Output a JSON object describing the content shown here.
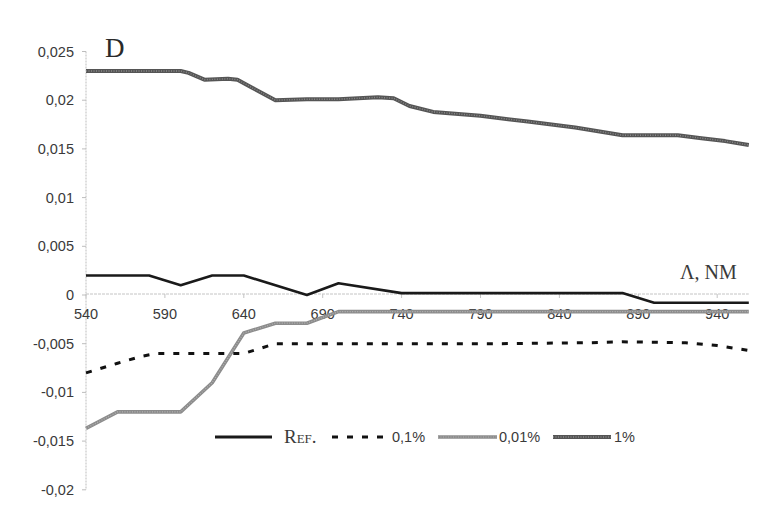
{
  "chart_data": {
    "type": "line",
    "title": "",
    "ylabel": "D",
    "xlabel": "Λ, NM",
    "xlim": [
      540,
      960
    ],
    "ylim": [
      -0.02,
      0.025
    ],
    "grid": false,
    "legend_position": "bottom-center (inside plot)",
    "x_ticks": [
      540,
      590,
      640,
      690,
      740,
      790,
      840,
      890,
      940
    ],
    "x_tick_labels": [
      "540",
      "590",
      "640",
      "690",
      "740",
      "790",
      "840",
      "890",
      "940"
    ],
    "y_ticks": [
      0.025,
      0.02,
      0.015,
      0.01,
      0.005,
      0,
      -0.005,
      -0.01,
      -0.015,
      -0.02
    ],
    "y_tick_labels": [
      "0,025",
      "0,02",
      "0,015",
      "0,01",
      "0,005",
      "0",
      "-0,005",
      "-0,01",
      "-0,015",
      "-0,02"
    ],
    "series": [
      {
        "name": "REF.",
        "style": "solid",
        "color": "#1a1a1a",
        "x": [
          540,
          580,
          600,
          620,
          640,
          680,
          700,
          740,
          880,
          900,
          960
        ],
        "values": [
          0.002,
          0.002,
          0.001,
          0.002,
          0.002,
          0.0,
          0.0012,
          0.0002,
          0.0002,
          -0.0008,
          -0.0008
        ]
      },
      {
        "name": "0,1%",
        "style": "dashed",
        "color": "#111111",
        "x": [
          540,
          560,
          575,
          585,
          600,
          620,
          640,
          650,
          660,
          680,
          700,
          740,
          800,
          860,
          880,
          920,
          940,
          960
        ],
        "values": [
          -0.008,
          -0.007,
          -0.0063,
          -0.006,
          -0.006,
          -0.006,
          -0.006,
          -0.0055,
          -0.005,
          -0.005,
          -0.005,
          -0.005,
          -0.005,
          -0.0049,
          -0.0048,
          -0.0049,
          -0.0052,
          -0.0057
        ]
      },
      {
        "name": "0,01%",
        "style": "solid-light-gray",
        "color": "#8c8c8c",
        "x": [
          540,
          560,
          600,
          620,
          640,
          660,
          680,
          700,
          960
        ],
        "values": [
          -0.0137,
          -0.012,
          -0.012,
          -0.009,
          -0.0039,
          -0.0029,
          -0.0029,
          -0.0017,
          -0.0017
        ]
      },
      {
        "name": "1%",
        "style": "textured-dark-gray",
        "color": "#5a5a5a",
        "x": [
          540,
          600,
          605,
          615,
          630,
          636,
          645,
          660,
          680,
          700,
          725,
          735,
          745,
          760,
          790,
          820,
          850,
          880,
          915,
          930,
          945,
          960
        ],
        "values": [
          0.023,
          0.023,
          0.0228,
          0.0221,
          0.0222,
          0.0221,
          0.0213,
          0.02,
          0.0201,
          0.0201,
          0.0203,
          0.0202,
          0.0194,
          0.0188,
          0.0184,
          0.0178,
          0.0172,
          0.0164,
          0.0164,
          0.0161,
          0.0158,
          0.0154
        ]
      }
    ]
  },
  "labels": {
    "y_axis_title": "D",
    "x_axis_title": "Λ, NM",
    "legend": {
      "ref": "Ref.",
      "p01": "0,1%",
      "p001": "0,01%",
      "p1": "1%"
    }
  }
}
